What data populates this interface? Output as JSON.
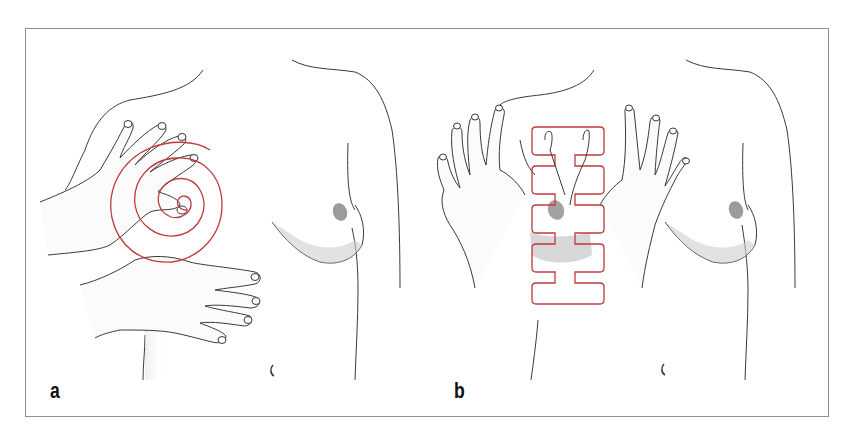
{
  "figure": {
    "panels": [
      {
        "label": "a",
        "technique": "circular spiral palpation",
        "pattern": "spiral"
      },
      {
        "label": "b",
        "technique": "vertical strip palpation",
        "pattern": "vertical-strip"
      }
    ],
    "colors": {
      "pattern_stroke": "#c0393b",
      "outline": "#3a3a3a",
      "frame": "#8f8f8f",
      "shading": "#d8d8d8"
    }
  }
}
